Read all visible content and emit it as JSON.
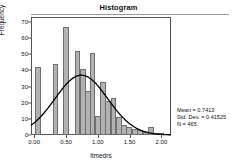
{
  "figure": {
    "title": "Histogram",
    "x_axis_title": "ltmedrs",
    "y_axis_title": "Frequency"
  },
  "stats": {
    "mean_label": "Mean = 0.7413",
    "sd_label": "Std. Dev. = 0.41525",
    "n_label": "N = 465"
  },
  "chart_data": {
    "type": "bar",
    "title": "Histogram",
    "xlabel": "ltmedrs",
    "ylabel": "Frequency",
    "xlim": [
      -0.05,
      2.15
    ],
    "ylim": [
      0,
      73
    ],
    "xticks": [
      0.0,
      0.5,
      1.0,
      1.5,
      2.0
    ],
    "xticklabels": [
      "0.00",
      "0.50",
      "1.00",
      "1.50",
      "2.00"
    ],
    "yticks": [
      0,
      10,
      20,
      30,
      40,
      50,
      60,
      70
    ],
    "yticklabels": [
      "0",
      "10",
      "20",
      "30",
      "40",
      "50",
      "60",
      "70"
    ],
    "grid": false,
    "legend": "none",
    "bin_width": 0.0875,
    "bins": [
      {
        "x": 0.02,
        "value": 42
      },
      {
        "x": 0.29,
        "value": 44
      },
      {
        "x": 0.455,
        "value": 67
      },
      {
        "x": 0.635,
        "value": 52
      },
      {
        "x": 0.72,
        "value": 41
      },
      {
        "x": 0.805,
        "value": 27
      },
      {
        "x": 0.875,
        "value": 51
      },
      {
        "x": 0.955,
        "value": 12
      },
      {
        "x": 1.04,
        "value": 33
      },
      {
        "x": 1.12,
        "value": 21
      },
      {
        "x": 1.2,
        "value": 23
      },
      {
        "x": 1.285,
        "value": 11
      },
      {
        "x": 1.37,
        "value": 6
      },
      {
        "x": 1.45,
        "value": 5
      },
      {
        "x": 1.54,
        "value": 4
      },
      {
        "x": 1.62,
        "value": 3
      },
      {
        "x": 1.705,
        "value": 2
      },
      {
        "x": 1.79,
        "value": 5
      },
      {
        "x": 1.875,
        "value": 1
      },
      {
        "x": 1.96,
        "value": 1
      }
    ],
    "overlay": {
      "type": "normal-curve",
      "mean": 0.7413,
      "sd": 0.41525,
      "n": 465,
      "peak_value": 37,
      "color": "#000000"
    },
    "annotations": [
      "Mean = 0.7413",
      "Std. Dev. = 0.41525",
      "N = 465"
    ]
  },
  "colors": {
    "bar_fill": "#b2b2b2",
    "bar_edge": "#6e6e6e",
    "axis": "#555555",
    "curve": "#000000",
    "text": "#111111"
  }
}
